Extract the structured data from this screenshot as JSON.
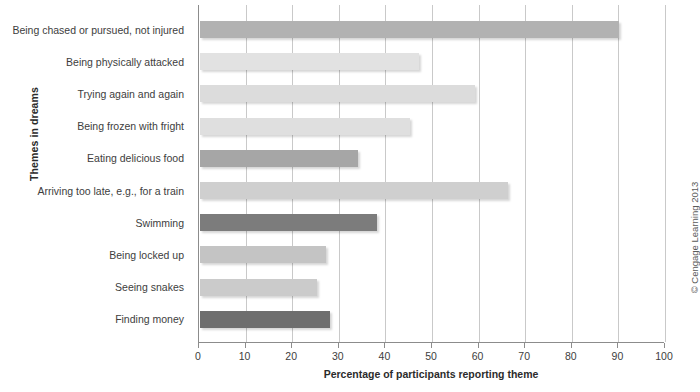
{
  "chart_data": {
    "type": "bar",
    "orientation": "horizontal",
    "title": "",
    "xlabel": "Percentage of participants reporting theme",
    "ylabel": "Themes in dreams",
    "xlim": [
      0,
      100
    ],
    "xticks": [
      0,
      10,
      20,
      30,
      40,
      50,
      60,
      70,
      80,
      90,
      100
    ],
    "xtick_labels": [
      "0",
      "10",
      "20",
      "30",
      "40",
      "50",
      "60",
      "70",
      "80",
      "90",
      "100"
    ],
    "grid": "vertical",
    "legend": "none",
    "categories": [
      "Being chased or pursued, not injured",
      "Being physically attacked",
      "Trying again and again",
      "Being frozen with fright",
      "Eating delicious food",
      "Arriving too late, e.g., for a train",
      "Swimming",
      "Being locked up",
      "Seeing snakes",
      "Finding money"
    ],
    "values": [
      90,
      47,
      59,
      45,
      34,
      66,
      38,
      27,
      25,
      28
    ],
    "bar_colors": [
      "#b2b2b2",
      "#e2e2e2",
      "#dcdcdc",
      "#dfdfdf",
      "#a6a6a6",
      "#cfcfcf",
      "#7c7c7c",
      "#c4c4c4",
      "#cbcbcb",
      "#6e6e6e"
    ],
    "axis_color": "#8c8c8c",
    "grid_color": "#c9c9c9"
  },
  "footer": {
    "copyright": "© Cengage Learning 2013"
  }
}
